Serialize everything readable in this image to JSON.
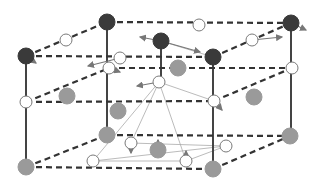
{
  "diagram": {
    "type": "crystal-structure",
    "colors": {
      "background": "#ffffff",
      "dark_atom": "#3a3a3a",
      "gray_atom": "#9a9a9a",
      "white_atom": "#ffffff",
      "atom_stroke": "#7a7a7a",
      "bond_dashed": "#333333",
      "edge_solid": "#444444",
      "thin_line": "#aaaaaa",
      "arrow": "#777777"
    },
    "solid_edges": [
      [
        26,
        56,
        26,
        167
      ],
      [
        107,
        22,
        107,
        135
      ],
      [
        213,
        57,
        213,
        169
      ],
      [
        291,
        23,
        291,
        136
      ],
      [
        161,
        41,
        161,
        82
      ]
    ],
    "dashed_edges": [
      [
        26,
        56,
        107,
        22
      ],
      [
        26,
        56,
        213,
        57
      ],
      [
        107,
        22,
        291,
        23
      ],
      [
        213,
        57,
        291,
        23
      ],
      [
        26,
        102,
        214,
        101
      ],
      [
        26,
        102,
        109,
        68
      ],
      [
        109,
        68,
        292,
        68
      ],
      [
        214,
        101,
        292,
        68
      ],
      [
        26,
        167,
        107,
        135
      ],
      [
        26,
        167,
        213,
        169
      ],
      [
        107,
        135,
        290,
        136
      ],
      [
        213,
        169,
        290,
        136
      ]
    ],
    "thin_edges": [
      [
        159,
        82,
        93,
        161
      ],
      [
        159,
        82,
        131,
        143
      ],
      [
        159,
        82,
        186,
        161
      ],
      [
        159,
        82,
        214,
        101
      ],
      [
        93,
        161,
        226,
        146
      ],
      [
        93,
        161,
        186,
        161
      ],
      [
        131,
        143,
        226,
        146
      ],
      [
        186,
        161,
        226,
        146
      ],
      [
        161,
        41,
        213,
        57
      ]
    ],
    "atoms": [
      {
        "x": 26,
        "y": 56,
        "r": 8,
        "kind": "dark"
      },
      {
        "x": 107,
        "y": 22,
        "r": 8,
        "kind": "dark"
      },
      {
        "x": 161,
        "y": 41,
        "r": 8,
        "kind": "dark"
      },
      {
        "x": 213,
        "y": 57,
        "r": 8,
        "kind": "dark"
      },
      {
        "x": 291,
        "y": 23,
        "r": 8,
        "kind": "dark"
      },
      {
        "x": 66,
        "y": 40,
        "r": 6,
        "kind": "white"
      },
      {
        "x": 199,
        "y": 25,
        "r": 6,
        "kind": "white"
      },
      {
        "x": 120,
        "y": 58,
        "r": 6,
        "kind": "white"
      },
      {
        "x": 109,
        "y": 68,
        "r": 6,
        "kind": "white"
      },
      {
        "x": 252,
        "y": 40,
        "r": 6,
        "kind": "white"
      },
      {
        "x": 178,
        "y": 68,
        "r": 8,
        "kind": "gray"
      },
      {
        "x": 26,
        "y": 102,
        "r": 6,
        "kind": "white"
      },
      {
        "x": 67,
        "y": 96,
        "r": 8,
        "kind": "gray"
      },
      {
        "x": 118,
        "y": 111,
        "r": 8,
        "kind": "gray"
      },
      {
        "x": 159,
        "y": 82,
        "r": 6,
        "kind": "white"
      },
      {
        "x": 214,
        "y": 101,
        "r": 6,
        "kind": "white"
      },
      {
        "x": 254,
        "y": 97,
        "r": 8,
        "kind": "gray"
      },
      {
        "x": 292,
        "y": 68,
        "r": 6,
        "kind": "white"
      },
      {
        "x": 107,
        "y": 135,
        "r": 8,
        "kind": "gray"
      },
      {
        "x": 26,
        "y": 167,
        "r": 8,
        "kind": "gray"
      },
      {
        "x": 131,
        "y": 143,
        "r": 6,
        "kind": "white"
      },
      {
        "x": 158,
        "y": 150,
        "r": 8,
        "kind": "gray"
      },
      {
        "x": 93,
        "y": 161,
        "r": 6,
        "kind": "white"
      },
      {
        "x": 186,
        "y": 161,
        "r": 6,
        "kind": "white"
      },
      {
        "x": 226,
        "y": 146,
        "r": 6,
        "kind": "white"
      },
      {
        "x": 213,
        "y": 169,
        "r": 8,
        "kind": "gray"
      },
      {
        "x": 290,
        "y": 136,
        "r": 8,
        "kind": "gray"
      }
    ],
    "arrows": [
      [
        26,
        56,
        36,
        63
      ],
      [
        120,
        58,
        88,
        66
      ],
      [
        161,
        41,
        140,
        37
      ],
      [
        161,
        41,
        200,
        52
      ],
      [
        252,
        40,
        282,
        37
      ],
      [
        291,
        23,
        306,
        30
      ],
      [
        159,
        82,
        137,
        86
      ],
      [
        214,
        101,
        222,
        110
      ],
      [
        131,
        143,
        131,
        153
      ],
      [
        158,
        150,
        158,
        140
      ],
      [
        186,
        161,
        186,
        151
      ],
      [
        109,
        68,
        120,
        72
      ]
    ]
  }
}
